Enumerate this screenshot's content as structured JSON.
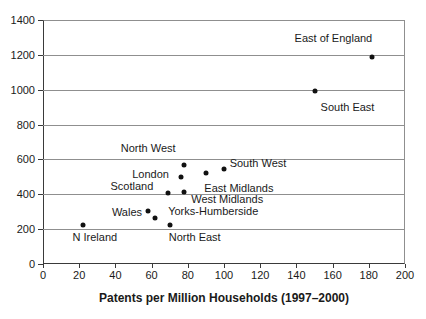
{
  "chart_data": {
    "type": "scatter",
    "title": "",
    "xlabel": "Patents per Million Households (1997–2000)",
    "ylabel": "",
    "xlim": [
      0,
      200
    ],
    "ylim": [
      0,
      1400
    ],
    "x_tick_step": 20,
    "y_tick_step": 200,
    "x_ticks": [
      0,
      20,
      40,
      60,
      80,
      100,
      120,
      140,
      160,
      180,
      200
    ],
    "y_ticks": [
      0,
      200,
      400,
      600,
      800,
      1000,
      1200,
      1400
    ],
    "grid": "horizontal-only",
    "legend": "none",
    "marker": {
      "shape": "circle",
      "color": "#111111",
      "size_px": 5
    },
    "colors": {
      "background": "#ffffff",
      "gridline": "#8f8f8f",
      "axis": "#3a3a3a",
      "text": "#1a1a1a"
    },
    "points": [
      {
        "region": "N Ireland",
        "x": 22,
        "y": 225,
        "label_dx": 12,
        "label_dy": 12
      },
      {
        "region": "Wales",
        "x": 58,
        "y": 305,
        "label_dx": -21,
        "label_dy": 1
      },
      {
        "region": "Yorks-Humberside",
        "x": 62,
        "y": 265,
        "label_dx": 58,
        "label_dy": -7
      },
      {
        "region": "North East",
        "x": 70,
        "y": 225,
        "label_dx": 25,
        "label_dy": 12
      },
      {
        "region": "Scotland",
        "x": 69,
        "y": 410,
        "label_dx": -36,
        "label_dy": -7
      },
      {
        "region": "West Midlands",
        "x": 78,
        "y": 415,
        "label_dx": 43,
        "label_dy": 7
      },
      {
        "region": "London",
        "x": 76,
        "y": 500,
        "label_dx": -30,
        "label_dy": -3
      },
      {
        "region": "North West",
        "x": 78,
        "y": 570,
        "label_dx": -36,
        "label_dy": -17
      },
      {
        "region": "East Midlands",
        "x": 90,
        "y": 525,
        "label_dx": 33,
        "label_dy": 15
      },
      {
        "region": "South West",
        "x": 100,
        "y": 545,
        "label_dx": 34,
        "label_dy": -6
      },
      {
        "region": "South East",
        "x": 150,
        "y": 990,
        "label_dx": 33,
        "label_dy": 16
      },
      {
        "region": "East of England",
        "x": 182,
        "y": 1190,
        "label_dx": -39,
        "label_dy": -19
      }
    ]
  }
}
